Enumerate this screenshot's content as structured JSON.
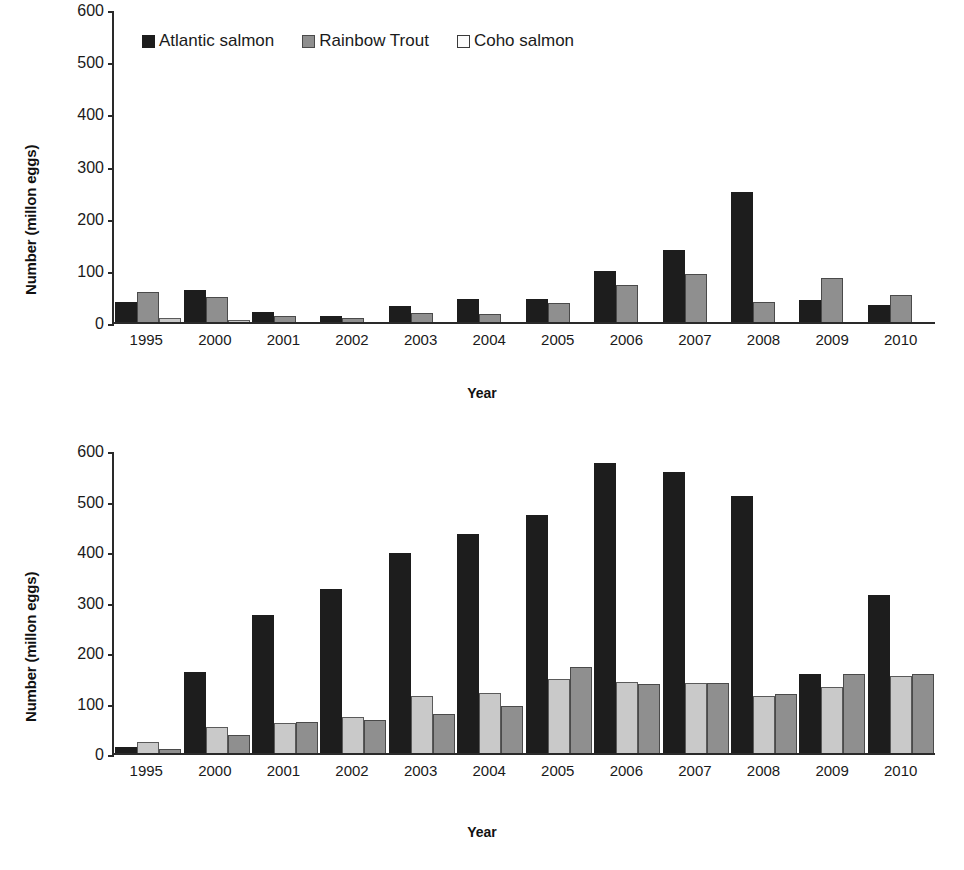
{
  "figure": {
    "legend": {
      "entries": [
        {
          "label": "Atlantic salmon",
          "swatch": "dark-square-icon",
          "color": "#1d1d1d"
        },
        {
          "label": "Rainbow Trout",
          "swatch": "gray-square-icon",
          "color": "#8f8f8f"
        },
        {
          "label": "Coho salmon",
          "swatch": "light-square-icon",
          "color": "#fbfbfb"
        }
      ]
    },
    "panels": [
      {
        "id": "top",
        "ylabel": "Number (millon eggs)",
        "xlabel": "Year"
      },
      {
        "id": "bottom",
        "ylabel": "Number (millon eggs)",
        "xlabel": "Year"
      }
    ]
  },
  "chart_data": [
    {
      "type": "bar",
      "title": "",
      "xlabel": "Year",
      "ylabel": "Number (millon eggs)",
      "ylim": [
        0,
        600
      ],
      "yticks": [
        0,
        100,
        200,
        300,
        400,
        500,
        600
      ],
      "grid": false,
      "legend_position": "top-left-inside",
      "categories": [
        "1995",
        "2000",
        "2001",
        "2002",
        "2003",
        "2004",
        "2005",
        "2006",
        "2007",
        "2008",
        "2009",
        "2010"
      ],
      "series": [
        {
          "name": "Atlantic salmon",
          "color": "#1d1d1d",
          "values": [
            38,
            62,
            20,
            11,
            30,
            45,
            44,
            98,
            139,
            249,
            42,
            33
          ]
        },
        {
          "name": "Rainbow Trout",
          "color": "#8f8f8f",
          "values": [
            57,
            48,
            11,
            8,
            18,
            15,
            37,
            70,
            93,
            38,
            85,
            52
          ]
        },
        {
          "name": "Coho salmon",
          "color": "#fbfbfb",
          "values": [
            7,
            3,
            0,
            0,
            0,
            0,
            0,
            0,
            0,
            0,
            0,
            0
          ]
        }
      ]
    },
    {
      "type": "bar",
      "title": "",
      "xlabel": "Year",
      "ylabel": "Number (millon eggs)",
      "ylim": [
        0,
        600
      ],
      "yticks": [
        0,
        100,
        200,
        300,
        400,
        500,
        600
      ],
      "grid": false,
      "legend_position": "none",
      "categories": [
        "1995",
        "2000",
        "2001",
        "2002",
        "2003",
        "2004",
        "2005",
        "2006",
        "2007",
        "2008",
        "2009",
        "2010"
      ],
      "series": [
        {
          "name": "Atlantic salmon",
          "color": "#1d1d1d",
          "values": [
            12,
            160,
            274,
            325,
            396,
            434,
            472,
            575,
            556,
            509,
            156,
            313
          ]
        },
        {
          "name": "Coho salmon",
          "color": "#c9c9c9",
          "values": [
            22,
            52,
            59,
            71,
            112,
            118,
            147,
            140,
            139,
            112,
            130,
            152
          ]
        },
        {
          "name": "Rainbow Trout",
          "color": "#8f8f8f",
          "values": [
            7,
            36,
            61,
            65,
            77,
            94,
            171,
            137,
            139,
            116,
            156,
            156
          ]
        }
      ]
    }
  ]
}
